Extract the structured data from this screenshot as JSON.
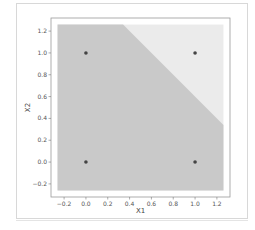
{
  "chart_data": {
    "type": "scatter",
    "title": "",
    "xlabel": "X1",
    "ylabel": "X2",
    "xlim": [
      -0.32,
      1.32
    ],
    "ylim": [
      -0.32,
      1.32
    ],
    "xticks": [
      "-0.2",
      "0.0",
      "0.2",
      "0.4",
      "0.6",
      "0.8",
      "1.0",
      "1.2"
    ],
    "yticks": [
      "-0.2",
      "0.0",
      "0.2",
      "0.4",
      "0.6",
      "0.8",
      "1.0",
      "1.2"
    ],
    "grid": false,
    "legend": null,
    "points": [
      {
        "x": 0,
        "y": 0
      },
      {
        "x": 0,
        "y": 1
      },
      {
        "x": 1,
        "y": 0
      },
      {
        "x": 1,
        "y": 1
      }
    ],
    "decision_regions": {
      "x_range": [
        -0.26,
        1.26
      ],
      "y_range": [
        -0.26,
        1.26
      ],
      "boundary": {
        "type": "line",
        "equation": "x1 + x2 = 1.6",
        "from": [
          0.34,
          1.26
        ],
        "to": [
          1.26,
          0.34
        ]
      },
      "regions": [
        {
          "label": "class 0",
          "side": "below boundary",
          "color": "#c9c9c9"
        },
        {
          "label": "class 1",
          "side": "above boundary",
          "color": "#ebebeb"
        }
      ]
    },
    "point_color": "#444444"
  }
}
